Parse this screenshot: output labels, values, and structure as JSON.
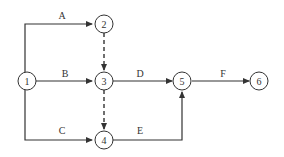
{
  "diagram": {
    "type": "activity-on-arrow network",
    "nodes": [
      {
        "id": "1",
        "label": "1",
        "x": 27,
        "y": 81
      },
      {
        "id": "2",
        "label": "2",
        "x": 103,
        "y": 24
      },
      {
        "id": "3",
        "label": "3",
        "x": 103,
        "y": 81
      },
      {
        "id": "4",
        "label": "4",
        "x": 103,
        "y": 140
      },
      {
        "id": "5",
        "label": "5",
        "x": 183,
        "y": 81
      },
      {
        "id": "6",
        "label": "6",
        "x": 260,
        "y": 81
      }
    ],
    "activities": [
      {
        "label": "A",
        "from": "1",
        "to": "2",
        "dashed": false
      },
      {
        "label": "B",
        "from": "1",
        "to": "3",
        "dashed": false
      },
      {
        "label": "C",
        "from": "1",
        "to": "4",
        "dashed": false
      },
      {
        "label": "D",
        "from": "3",
        "to": "5",
        "dashed": false
      },
      {
        "label": "E",
        "from": "4",
        "to": "5",
        "dashed": false
      },
      {
        "label": "F",
        "from": "5",
        "to": "6",
        "dashed": false
      },
      {
        "label": "",
        "from": "2",
        "to": "3",
        "dashed": true
      },
      {
        "label": "",
        "from": "3",
        "to": "4",
        "dashed": true
      }
    ]
  }
}
